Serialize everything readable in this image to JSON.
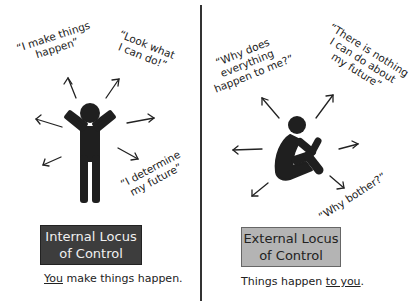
{
  "left_panel": {
    "title_line1": "Internal Locus",
    "title_line2": "of Control",
    "caption_underlined": "You",
    "caption_rest": " make things happen.",
    "quotes": [
      "“I make things\nhappen”",
      "“Look what\nI can do!”",
      "“I determine\nmy future”"
    ],
    "figure": "person-arms-raised-icon",
    "box_color": "#3d3d3d"
  },
  "right_panel": {
    "title_line1": "External Locus",
    "title_line2": "of Control",
    "caption_prefix": "Things happen ",
    "caption_underlined": "to you",
    "caption_suffix": ".",
    "quotes": [
      "“Why does\neverything\nhappen to me?”",
      "“There is nothing\nI can do about\nmy future”",
      "“Why bother?”"
    ],
    "figure": "person-sitting-hugging-knees-icon",
    "box_color": "#b4b4b4"
  }
}
